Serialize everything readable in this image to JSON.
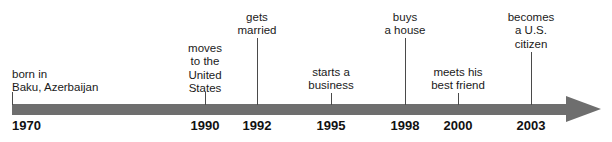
{
  "figure": {
    "kind": "timeline",
    "axis": {
      "color": "#6e6e6e",
      "start_x": 12,
      "end_x": 570,
      "arrow_tip_x": 600,
      "has_arrowhead": true,
      "direction": "left-to-right"
    },
    "stem_color": "#4a4a4a",
    "text_color": "#1a1a1a"
  },
  "events": [
    {
      "id": "born",
      "year": "1970",
      "label_lines": [
        "born in",
        "Baku, Azerbaijan"
      ],
      "x": 12,
      "label_top": 68,
      "align": "left",
      "stem_top": 92,
      "stem_height": 13
    },
    {
      "id": "moves",
      "year": "1990",
      "label_lines": [
        "moves",
        "to the",
        "United",
        "States"
      ],
      "x": 205,
      "label_top": 42,
      "align": "center",
      "stem_top": 92,
      "stem_height": 13
    },
    {
      "id": "married",
      "year": "1992",
      "label_lines": [
        "gets",
        "married"
      ],
      "x": 257,
      "label_top": 11,
      "align": "center",
      "stem_top": 38,
      "stem_height": 67
    },
    {
      "id": "business",
      "year": "1995",
      "label_lines": [
        "starts a",
        "business"
      ],
      "x": 331,
      "label_top": 66,
      "align": "center",
      "stem_top": 93,
      "stem_height": 12
    },
    {
      "id": "house",
      "year": "1998",
      "label_lines": [
        "buys",
        "a house"
      ],
      "x": 405,
      "label_top": 11,
      "align": "center",
      "stem_top": 38,
      "stem_height": 67
    },
    {
      "id": "friend",
      "year": "2000",
      "label_lines": [
        "meets his",
        "best friend"
      ],
      "x": 458,
      "label_top": 66,
      "align": "center",
      "stem_top": 93,
      "stem_height": 12
    },
    {
      "id": "citizen",
      "year": "2003",
      "label_lines": [
        "becomes",
        "a U.S.",
        "citizen"
      ],
      "x": 531,
      "label_top": 11,
      "align": "center",
      "stem_top": 52,
      "stem_height": 53
    }
  ],
  "year_ticks": [
    {
      "year": "1970",
      "x": 12,
      "align": "left"
    },
    {
      "year": "1990",
      "x": 205,
      "align": "center"
    },
    {
      "year": "1992",
      "x": 257,
      "align": "center"
    },
    {
      "year": "1995",
      "x": 331,
      "align": "center"
    },
    {
      "year": "1998",
      "x": 405,
      "align": "center"
    },
    {
      "year": "2000",
      "x": 458,
      "align": "center"
    },
    {
      "year": "2003",
      "x": 531,
      "align": "center"
    }
  ],
  "chart_data": {
    "type": "timeline",
    "title": "",
    "xlabel": "",
    "ylabel": "",
    "axis_range": [
      "1970",
      "2003+"
    ],
    "grid": false,
    "legend": "none",
    "categories": [
      "1970",
      "1990",
      "1992",
      "1995",
      "1998",
      "2000",
      "2003"
    ],
    "values": [
      1970,
      1990,
      1992,
      1995,
      1998,
      2000,
      2003
    ],
    "annotations": [
      "born in Baku, Azerbaijan",
      "moves to the United States",
      "gets married",
      "starts a business",
      "buys a house",
      "meets his best friend",
      "becomes a U.S. citizen"
    ],
    "points": [
      {
        "x": "1970",
        "label": "born in Baku, Azerbaijan"
      },
      {
        "x": "1990",
        "label": "moves to the United States"
      },
      {
        "x": "1992",
        "label": "gets married"
      },
      {
        "x": "1995",
        "label": "starts a business"
      },
      {
        "x": "1998",
        "label": "buys a house"
      },
      {
        "x": "2000",
        "label": "meets his best friend"
      },
      {
        "x": "2003",
        "label": "becomes a U.S. citizen"
      }
    ]
  }
}
